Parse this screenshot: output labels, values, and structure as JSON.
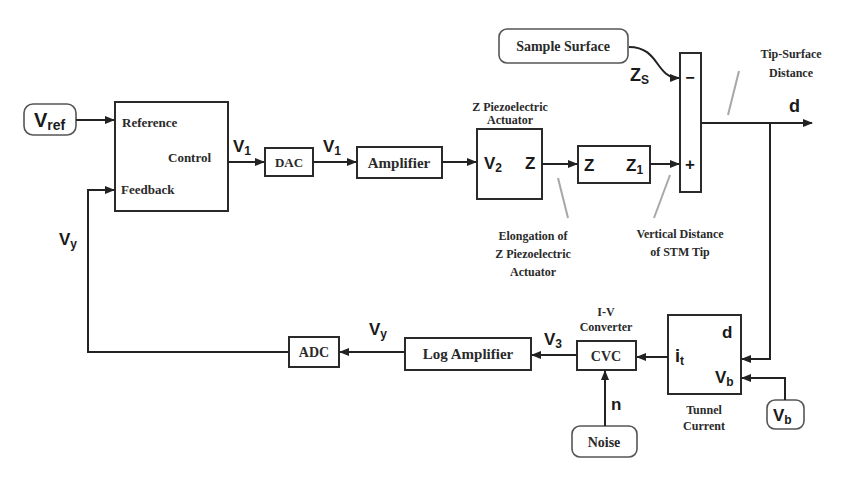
{
  "diagram": {
    "inputs": {
      "vref": {
        "main": "V",
        "sub": "ref"
      },
      "sample_surface": "Sample Surface",
      "noise": "Noise",
      "vb": {
        "main": "V",
        "sub": "b"
      }
    },
    "controller": {
      "reference": "Reference",
      "control": "Control",
      "feedback": "Feedback"
    },
    "blocks": {
      "dac": "DAC",
      "amplifier": "Amplifier",
      "piezo_title_1": "Z Piezoelectric",
      "piezo_title_2": "Actuator",
      "piezo_in": {
        "main": "V",
        "sub": "2"
      },
      "piezo_out": "Z",
      "tip_in": "Z",
      "tip_out": {
        "main": "Z",
        "sub": "1"
      },
      "summer_minus": "−",
      "summer_plus": "+",
      "cvc": "CVC",
      "iv_title_1": "I-V",
      "iv_title_2": "Converter",
      "log_amplifier": "Log Amplifier",
      "adc": "ADC",
      "tunnel_d": "d",
      "tunnel_it": {
        "main": "i",
        "sub": "t"
      },
      "tunnel_vb": {
        "main": "V",
        "sub": "b"
      },
      "tunnel_title_1": "Tunnel",
      "tunnel_title_2": "Current"
    },
    "signals": {
      "v1_a": {
        "main": "V",
        "sub": "1"
      },
      "v1_b": {
        "main": "V",
        "sub": "1"
      },
      "zs": {
        "main": "Z",
        "sub": "S"
      },
      "d": "d",
      "v3": {
        "main": "V",
        "sub": "3"
      },
      "vy_bottom": {
        "main": "V",
        "sub": "y"
      },
      "vy_left": {
        "main": "V",
        "sub": "y"
      },
      "n": "n"
    },
    "annotations": {
      "tip_surface_1": "Tip-Surface",
      "tip_surface_2": "Distance",
      "elongation_1": "Elongation of",
      "elongation_2": "Z Piezoelectric",
      "elongation_3": "Actuator",
      "vertical_1": "Vertical  Distance",
      "vertical_2": "of STM Tip"
    }
  }
}
